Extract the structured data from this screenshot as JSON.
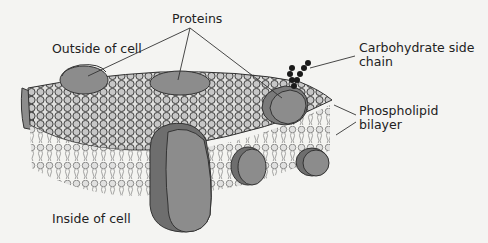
{
  "diagram": {
    "labels": {
      "proteins": "Proteins",
      "outside": "Outside of cell",
      "carbohydrate_line1": "Carbohydrate side",
      "carbohydrate_line2": "chain",
      "phospholipid_line1": "Phospholipid",
      "phospholipid_line2": "bilayer",
      "inside": "Inside of cell"
    },
    "colors": {
      "protein": "#8c8c8c",
      "protein_dark": "#6e6e6e",
      "head": "#d8d8d8",
      "outline": "#333333",
      "background": "#f4f4f2",
      "carbohydrate": "#1a1a1a"
    }
  }
}
